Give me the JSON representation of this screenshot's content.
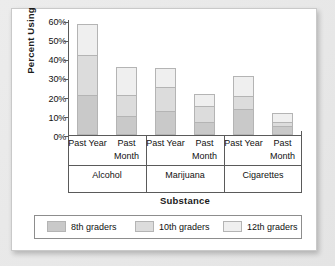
{
  "chart_data": {
    "type": "bar",
    "subtype": "stacked-bar",
    "title": "",
    "xlabel": "Substance",
    "ylabel": "Percent Using",
    "ylim": [
      0,
      60
    ],
    "yticks": [
      "0%",
      "10%",
      "20%",
      "30%",
      "40%",
      "50%",
      "60%"
    ],
    "ytick_values": [
      0,
      10,
      20,
      30,
      40,
      50,
      60
    ],
    "grid": false,
    "legend_position": "bottom",
    "categories": [
      "Alcohol / Past Year",
      "Alcohol / Past Month",
      "Marijuana / Past Year",
      "Marijuana / Past Month",
      "Cigarettes / Past Year",
      "Cigarettes / Past Month"
    ],
    "groups": [
      {
        "name": "Alcohol",
        "periods": [
          "Past Year",
          "Past Month"
        ]
      },
      {
        "name": "Marijuana",
        "periods": [
          "Past Year",
          "Past Month"
        ]
      },
      {
        "name": "Cigarettes",
        "periods": [
          "Past Year",
          "Past Month"
        ]
      }
    ],
    "series": [
      {
        "name": "8th graders",
        "color": "#c9c9c9",
        "values": [
          21.0,
          10.0,
          12.5,
          7.0,
          13.5,
          4.5
        ]
      },
      {
        "name": "10th graders",
        "color": "#dcdcdc",
        "values": [
          21.0,
          11.0,
          12.5,
          8.0,
          7.0,
          2.5
        ]
      },
      {
        "name": "12th graders",
        "color": "#efefef",
        "values": [
          16.0,
          14.5,
          10.0,
          6.5,
          10.5,
          4.5
        ]
      }
    ],
    "totals": [
      58.0,
      35.5,
      35.0,
      21.5,
      31.0,
      11.5
    ]
  },
  "legend": {
    "items": [
      {
        "label": "8th graders"
      },
      {
        "label": "10th graders"
      },
      {
        "label": "12th graders"
      }
    ]
  }
}
